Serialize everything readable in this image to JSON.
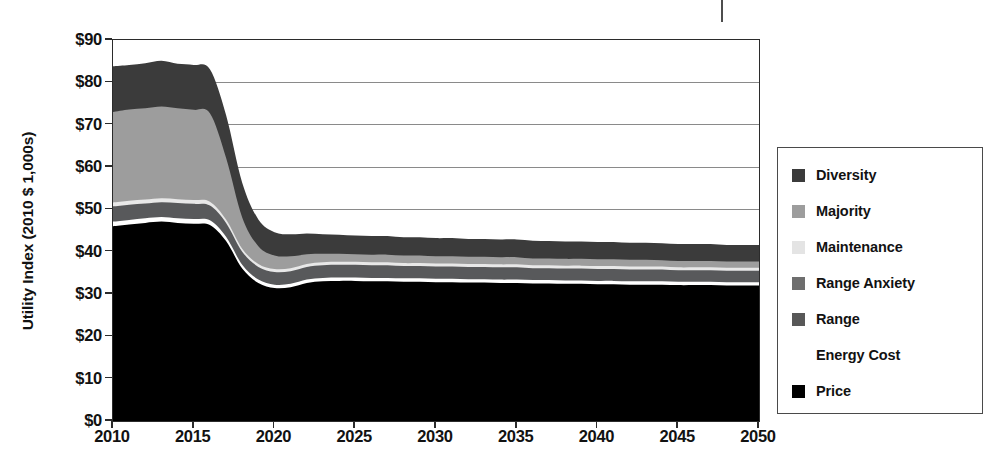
{
  "chart_data": {
    "type": "area",
    "stacked": true,
    "title": "",
    "subtitle": "",
    "xlabel": "",
    "ylabel": "Utility Index (2010 $ 1,000s)",
    "xlim": [
      2010,
      2050
    ],
    "ylim": [
      0,
      90
    ],
    "grid": true,
    "legend_position": "right",
    "y_tick_labels": [
      "$90",
      "$80",
      "$70",
      "$60",
      "$50",
      "$40",
      "$30",
      "$20",
      "$10",
      "$0"
    ],
    "y_tick_values": [
      90,
      80,
      70,
      60,
      50,
      40,
      30,
      20,
      10,
      0
    ],
    "x_tick_labels": [
      "2010",
      "2015",
      "2020",
      "2025",
      "2030",
      "2035",
      "2040",
      "2045",
      "2050"
    ],
    "x_tick_values": [
      2010,
      2015,
      2020,
      2025,
      2030,
      2035,
      2040,
      2045,
      2050
    ],
    "x": [
      2010,
      2011,
      2012,
      2013,
      2014,
      2015,
      2016,
      2017,
      2018,
      2019,
      2020,
      2021,
      2022,
      2023,
      2024,
      2025,
      2026,
      2027,
      2028,
      2029,
      2030,
      2031,
      2032,
      2033,
      2034,
      2035,
      2036,
      2037,
      2038,
      2039,
      2040,
      2041,
      2042,
      2043,
      2044,
      2045,
      2046,
      2047,
      2048,
      2049,
      2050
    ],
    "stack_order_bottom_to_top": [
      "Price",
      "Energy Cost",
      "Range",
      "Maintenance",
      "Majority",
      "Diversity"
    ],
    "series": [
      {
        "name": "Price",
        "color": "#000000",
        "values": [
          46.0,
          46.4,
          46.8,
          47.1,
          46.8,
          46.6,
          46.3,
          42.5,
          36.0,
          32.6,
          31.4,
          31.6,
          32.6,
          33.0,
          33.1,
          33.1,
          33.0,
          33.0,
          32.9,
          32.9,
          32.8,
          32.8,
          32.7,
          32.7,
          32.6,
          32.6,
          32.5,
          32.5,
          32.4,
          32.4,
          32.3,
          32.3,
          32.2,
          32.2,
          32.2,
          32.1,
          32.1,
          32.1,
          32.0,
          32.0,
          32.0
        ]
      },
      {
        "name": "Energy Cost",
        "color": "#ffffff",
        "values": [
          1.1,
          1.1,
          1.1,
          1.1,
          1.1,
          1.1,
          1.1,
          1.0,
          0.9,
          0.8,
          0.8,
          0.8,
          0.8,
          0.8,
          0.8,
          0.8,
          0.8,
          0.8,
          0.8,
          0.8,
          0.8,
          0.8,
          0.8,
          0.8,
          0.8,
          0.8,
          0.8,
          0.8,
          0.8,
          0.8,
          0.8,
          0.8,
          0.8,
          0.8,
          0.8,
          0.8,
          0.8,
          0.8,
          0.8,
          0.8,
          0.8
        ]
      },
      {
        "name": "Range",
        "color": "#58595b",
        "values": [
          3.6,
          3.6,
          3.5,
          3.5,
          3.6,
          3.6,
          3.5,
          3.3,
          3.1,
          3.0,
          3.0,
          3.0,
          3.0,
          3.0,
          3.0,
          3.0,
          3.0,
          3.0,
          2.9,
          2.9,
          2.9,
          2.9,
          2.9,
          2.9,
          2.9,
          2.9,
          2.8,
          2.8,
          2.8,
          2.8,
          2.8,
          2.8,
          2.8,
          2.8,
          2.8,
          2.7,
          2.7,
          2.7,
          2.7,
          2.7,
          2.7
        ]
      },
      {
        "name": "Maintenance",
        "color": "#e8e8e8",
        "values": [
          0.9,
          0.9,
          0.9,
          0.9,
          0.9,
          0.9,
          0.9,
          0.8,
          0.7,
          0.7,
          0.7,
          0.7,
          0.7,
          0.7,
          0.7,
          0.7,
          0.7,
          0.7,
          0.7,
          0.7,
          0.7,
          0.7,
          0.7,
          0.7,
          0.7,
          0.7,
          0.7,
          0.7,
          0.7,
          0.7,
          0.7,
          0.7,
          0.7,
          0.7,
          0.7,
          0.7,
          0.7,
          0.7,
          0.7,
          0.7,
          0.7
        ]
      },
      {
        "name": "Majority",
        "color": "#9d9d9d",
        "values": [
          21.4,
          21.6,
          21.6,
          21.7,
          21.5,
          21.3,
          20.9,
          14.6,
          7.4,
          4.2,
          3.2,
          2.8,
          2.3,
          2.0,
          1.9,
          1.8,
          1.8,
          1.8,
          1.8,
          1.8,
          1.7,
          1.7,
          1.7,
          1.7,
          1.7,
          1.7,
          1.6,
          1.6,
          1.6,
          1.6,
          1.6,
          1.6,
          1.6,
          1.6,
          1.5,
          1.5,
          1.5,
          1.5,
          1.5,
          1.5,
          1.5
        ]
      },
      {
        "name": "Diversity",
        "color": "#3b3b3b",
        "values": [
          10.8,
          10.5,
          10.6,
          10.8,
          10.5,
          10.6,
          10.4,
          10.1,
          8.2,
          6.3,
          5.5,
          5.2,
          4.9,
          4.6,
          4.5,
          4.4,
          4.4,
          4.4,
          4.3,
          4.3,
          4.3,
          4.3,
          4.2,
          4.2,
          4.2,
          4.2,
          4.2,
          4.1,
          4.1,
          4.1,
          4.1,
          4.1,
          4.0,
          4.0,
          4.0,
          4.0,
          4.0,
          4.0,
          3.9,
          3.9,
          3.9
        ]
      }
    ],
    "stack_totals": [
      83.8,
      84.1,
      84.5,
      85.1,
      84.4,
      84.1,
      83.1,
      72.3,
      56.3,
      47.6,
      44.6,
      44.1,
      44.3,
      44.1,
      44.0,
      43.8,
      43.7,
      43.7,
      43.4,
      43.4,
      43.2,
      43.2,
      43.0,
      43.0,
      42.9,
      42.9,
      42.6,
      42.5,
      42.4,
      42.4,
      42.3,
      42.3,
      42.1,
      42.1,
      42.0,
      41.8,
      41.8,
      41.8,
      41.6,
      41.6,
      41.6
    ],
    "legend_entries": [
      {
        "label": "Diversity",
        "color": "#3b3b3b",
        "swatch_visible": true
      },
      {
        "label": "Majority",
        "color": "#9d9d9d",
        "swatch_visible": true
      },
      {
        "label": "Maintenance",
        "color": "#e4e4e4",
        "swatch_visible": true
      },
      {
        "label": "Range Anxiety",
        "color": "#6e6e6e",
        "swatch_visible": true
      },
      {
        "label": "Range",
        "color": "#585858",
        "swatch_visible": true
      },
      {
        "label": "Energy Cost",
        "color": "#ffffff",
        "swatch_visible": false
      },
      {
        "label": "Price",
        "color": "#000000",
        "swatch_visible": true
      }
    ]
  },
  "colors": {
    "axis": "#2b2b2b",
    "gridline": "#8a8a8a",
    "text": "#121212",
    "legend_border": "#4a4a4a",
    "background": "#ffffff"
  }
}
